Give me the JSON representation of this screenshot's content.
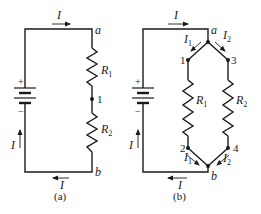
{
  "figure": {
    "type": "circuit-diagram",
    "panels": [
      {
        "caption": "(a)",
        "configuration": "series",
        "battery": {
          "plus": "+",
          "minus": "−"
        },
        "current_label": "I",
        "nodes": {
          "a": "a",
          "n1": "1",
          "b": "b"
        },
        "resistors": [
          {
            "label": "R",
            "subscript": "1"
          },
          {
            "label": "R",
            "subscript": "2"
          }
        ]
      },
      {
        "caption": "(b)",
        "configuration": "parallel",
        "battery": {
          "plus": "+",
          "minus": "−"
        },
        "current_label": "I",
        "branch_currents": [
          {
            "label": "I",
            "subscript": "1"
          },
          {
            "label": "I",
            "subscript": "2"
          }
        ],
        "nodes": {
          "a": "a",
          "n1": "1",
          "n2": "2",
          "n3": "3",
          "n4": "4",
          "b": "b"
        },
        "resistors": [
          {
            "label": "R",
            "subscript": "1"
          },
          {
            "label": "R",
            "subscript": "2"
          }
        ]
      }
    ]
  }
}
